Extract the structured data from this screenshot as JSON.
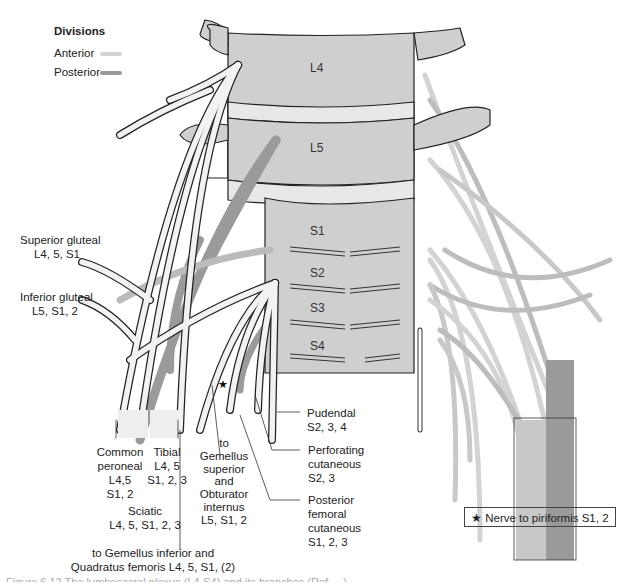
{
  "legend": {
    "title": "Divisions",
    "items": [
      {
        "label": "Anterior",
        "color": "#d3d3d3"
      },
      {
        "label": "Posterior",
        "color": "#9a9a9a"
      }
    ]
  },
  "vertebrae": [
    "L4",
    "L5",
    "S1",
    "S2",
    "S3",
    "S4"
  ],
  "roots": [
    "L4",
    "L5",
    "S1",
    "S2",
    "S3",
    "S4"
  ],
  "nerves": {
    "superior_gluteal": {
      "name": "Superior gluteal",
      "roots": "L4, 5, S1"
    },
    "inferior_gluteal": {
      "name": "Inferior gluteal",
      "roots": "L5, S1, 2"
    },
    "common_peroneal": {
      "name1": "Common",
      "name2": "peroneal",
      "roots1": "L4,5",
      "roots2": "S1, 2"
    },
    "tibial": {
      "name": "Tibial",
      "roots1": "L4, 5",
      "roots2": "S1, 2, 3"
    },
    "sciatic": {
      "name": "Sciatic",
      "roots": "L4, 5, S1, 2, 3"
    },
    "gemellus_inferior": {
      "line1": "to Gemellus inferior and",
      "line2": "Quadratus femoris L4, 5, S1, (2)"
    },
    "gemellus_superior": {
      "l1": "to",
      "l2": "Gemellus",
      "l3": "superior",
      "l4": "and",
      "l5": "Obturator",
      "l6": "internus",
      "l7": "L5, S1, 2"
    },
    "pudendal": {
      "name": "Pudendal",
      "roots": "S2, 3, 4"
    },
    "perforating_cutaneous": {
      "name1": "Perforating",
      "name2": "cutaneous",
      "roots": "S2, 3"
    },
    "posterior_femoral_cutaneous": {
      "name1": "Posterior",
      "name2": "femoral",
      "name3": "cutaneous",
      "roots": "S1, 2, 3"
    }
  },
  "key_box": {
    "symbol": "★",
    "text": "Nerve to piriformis S1, 2"
  },
  "caption": "Figure 6.12   The lumbosacral plexus (L4-S4) and its branches (Ref. ...)"
}
